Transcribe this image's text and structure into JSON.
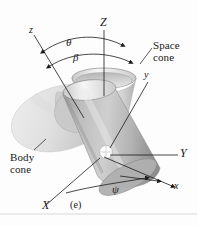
{
  "figure": {
    "caption": "(e)",
    "labels": {
      "axis_Z": "Z",
      "axis_Y": "Y",
      "axis_X": "X",
      "axis_z": "z",
      "axis_y": "y",
      "axis_x": "x",
      "angle_theta": "θ",
      "angle_beta": "β",
      "angle_psi": "ψ",
      "space_cone_line1": "Space",
      "space_cone_line2": "cone",
      "body_cone_line1": "Body",
      "body_cone_line2": "cone"
    },
    "colors": {
      "background": "#fdfdfd",
      "ink": "#1a1a1a",
      "body_cone_fill": "#e2e2e2",
      "space_cone_fill": "#cfcfcf",
      "cylinder_fill": "#b4b4b4",
      "highlight": "#f2f2f2",
      "shadow": "#8f8f8f",
      "origin_marker": "#ffffff"
    }
  }
}
